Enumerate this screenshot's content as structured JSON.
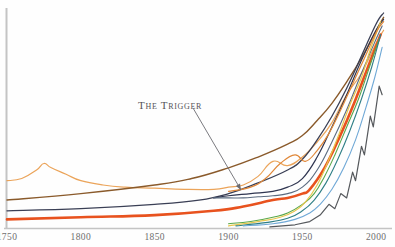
{
  "figure": {
    "annotation": {
      "text": "The Trigger",
      "leader_from": [
        193,
        108
      ],
      "leader_to": [
        241,
        190
      ]
    },
    "axes": {
      "xlabel": "",
      "ylabel": "",
      "x_ticks": [
        "1750",
        "1800",
        "1850",
        "1900",
        "1950",
        "2000"
      ],
      "axis_color": "#bdbdbd"
    }
  },
  "chart_data": {
    "type": "line",
    "subtitle": "",
    "xlabel": "",
    "ylabel": "",
    "xlim": [
      1750,
      2010
    ],
    "ylim": [
      0,
      100
    ],
    "grid": false,
    "legend": "none",
    "x_ticks": [
      1750,
      1800,
      1850,
      1900,
      1950,
      2000
    ],
    "annotations": [
      {
        "text": "The Trigger",
        "x": 1905,
        "y": 62,
        "points_to_x": 1948,
        "points_to_y": 12
      }
    ],
    "series": [
      {
        "name": "series-light-orange-peaked",
        "color": "#eba45a",
        "width": 1.2,
        "x": [
          1750,
          1760,
          1770,
          1775,
          1780,
          1790,
          1800,
          1815,
          1830,
          1850,
          1870,
          1890,
          1900,
          1910,
          1920,
          1930,
          1940,
          1950,
          1960,
          1970,
          1980,
          1990,
          2000,
          2005
        ],
        "y": [
          22,
          23,
          27,
          30,
          28,
          25,
          22,
          20,
          19,
          18.5,
          18,
          18,
          19,
          20,
          24,
          31,
          29,
          33,
          40,
          49,
          62,
          72,
          86,
          92
        ]
      },
      {
        "name": "series-brown",
        "color": "#8a5a2b",
        "width": 1.4,
        "x": [
          1750,
          1800,
          1850,
          1875,
          1900,
          1920,
          1940,
          1950,
          1960,
          1970,
          1980,
          1990,
          2000,
          2005
        ],
        "y": [
          13,
          16,
          20,
          23,
          28,
          33,
          39,
          43,
          50,
          58,
          68,
          79,
          92,
          98
        ]
      },
      {
        "name": "series-dark-navy-main",
        "color": "#3a3f55",
        "width": 1.3,
        "x": [
          1750,
          1800,
          1850,
          1880,
          1900,
          1920,
          1940,
          1950,
          1960,
          1970,
          1980,
          1990,
          2000,
          2005
        ],
        "y": [
          8,
          9,
          11,
          13,
          16,
          21,
          27,
          32,
          41,
          52,
          65,
          80,
          95,
          100
        ]
      },
      {
        "name": "series-orange-red-thick",
        "color": "#e8521e",
        "width": 2.6,
        "x": [
          1750,
          1800,
          1850,
          1890,
          1910,
          1930,
          1940,
          1950,
          1955,
          1965,
          1975,
          1985,
          1995,
          2003
        ],
        "y": [
          4,
          5,
          6,
          8,
          10,
          13,
          14,
          16,
          18,
          28,
          42,
          58,
          76,
          90
        ]
      },
      {
        "name": "series-dark-navy-steep",
        "color": "#2f3550",
        "width": 1.2,
        "x": [
          1890,
          1900,
          1915,
          1930,
          1940,
          1950,
          1960,
          1970,
          1980,
          1990,
          2000,
          2005
        ],
        "y": [
          14,
          15,
          16,
          17,
          19,
          23,
          33,
          47,
          62,
          78,
          92,
          97
        ]
      },
      {
        "name": "series-slate-blue-flat",
        "color": "#5b6b80",
        "width": 1.1,
        "x": [
          1890,
          1900,
          1910,
          1920,
          1930,
          1940,
          1950,
          1960,
          1970,
          1980,
          1990,
          2000,
          2004
        ],
        "y": [
          14,
          14,
          14,
          14.5,
          15,
          16,
          19,
          27,
          40,
          55,
          72,
          88,
          94
        ]
      },
      {
        "name": "series-green",
        "color": "#5aa84a",
        "width": 1.1,
        "x": [
          1900,
          1915,
          1930,
          1940,
          1950,
          1958,
          1965,
          1972,
          1980,
          1988,
          1995,
          2002
        ],
        "y": [
          2,
          3,
          5,
          7,
          11,
          16,
          24,
          34,
          47,
          60,
          74,
          88
        ]
      },
      {
        "name": "series-yellow",
        "color": "#e6c74f",
        "width": 1.2,
        "x": [
          1900,
          1920,
          1935,
          1945,
          1952,
          1960,
          1968,
          1975,
          1982,
          1990,
          1996,
          2003
        ],
        "y": [
          1,
          3,
          5,
          8,
          12,
          20,
          32,
          44,
          57,
          70,
          83,
          96
        ]
      },
      {
        "name": "series-teal",
        "color": "#2f7f86",
        "width": 1.1,
        "x": [
          1905,
          1925,
          1940,
          1950,
          1958,
          1966,
          1974,
          1982,
          1990,
          1997,
          2003
        ],
        "y": [
          1,
          2.5,
          4.5,
          8,
          13,
          21,
          32,
          45,
          60,
          75,
          90
        ]
      },
      {
        "name": "series-light-blue",
        "color": "#6fa8d6",
        "width": 1.1,
        "x": [
          1910,
          1930,
          1945,
          1955,
          1962,
          1970,
          1978,
          1986,
          1993,
          1999,
          2004
        ],
        "y": [
          1,
          2,
          4,
          7,
          11,
          18,
          28,
          41,
          56,
          70,
          84
        ]
      },
      {
        "name": "series-gray-zigzag",
        "color": "#55585c",
        "width": 1.2,
        "x": [
          1928,
          1945,
          1955,
          1962,
          1968,
          1972,
          1976,
          1980,
          1984,
          1986,
          1990,
          1992,
          1996,
          1998,
          2002,
          2004
        ],
        "y": [
          0.5,
          1.5,
          3,
          6,
          11,
          9,
          16,
          14,
          26,
          22,
          38,
          34,
          52,
          47,
          66,
          62
        ]
      },
      {
        "name": "series-orange-secondary",
        "color": "#e0883a",
        "width": 1.2,
        "x": [
          1900,
          1915,
          1925,
          1935,
          1945,
          1952,
          1960,
          1968,
          1976,
          1984,
          1992,
          2000,
          2005
        ],
        "y": [
          17,
          19,
          23,
          30,
          34,
          31,
          36,
          44,
          55,
          67,
          79,
          91,
          96
        ]
      }
    ]
  }
}
